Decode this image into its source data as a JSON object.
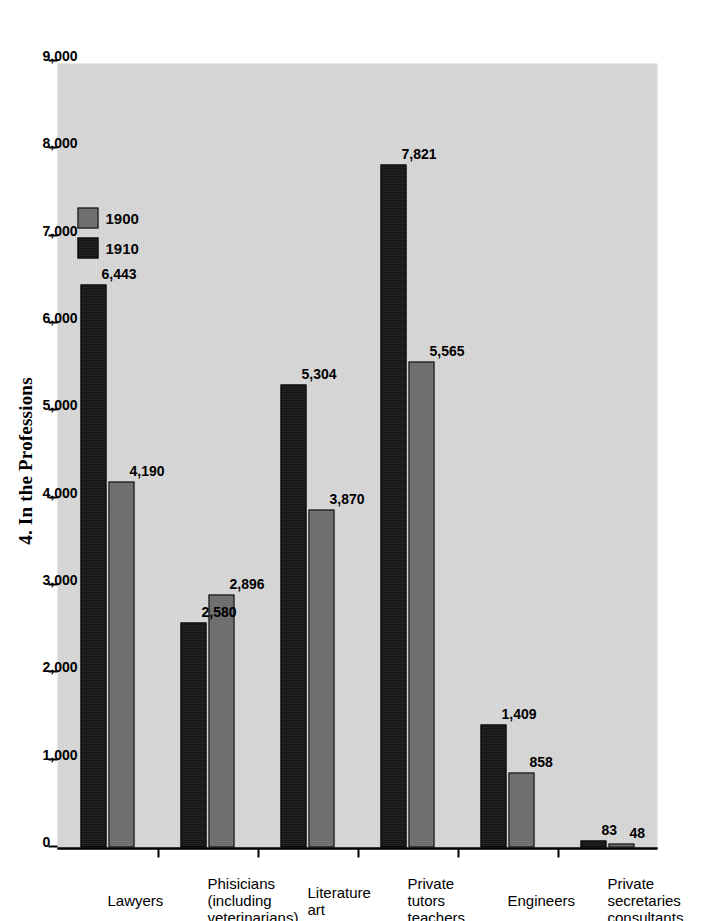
{
  "chart_data": {
    "type": "bar",
    "orientation": "horizontal",
    "title": "4. In the Professions",
    "xlabel": "",
    "ylabel": "",
    "grid": false,
    "legend_position": "top-left-of-plot",
    "xlim": [
      0,
      9000
    ],
    "xticks": [
      "0",
      "1,000",
      "2,000",
      "3,000",
      "4,000",
      "5,000",
      "6,000",
      "7,000",
      "8,000",
      "9,000"
    ],
    "xtick_values": [
      0,
      1000,
      2000,
      3000,
      4000,
      5000,
      6000,
      7000,
      8000,
      9000
    ],
    "categories": [
      "Lawyers",
      "Phisicians\n(including\nveterinarians)",
      "Literature\nart",
      "Private tutors\nteachers",
      "Engineers",
      "Private\nsecretaries\nconsultants"
    ],
    "series": [
      {
        "name": "1900",
        "color": "#6e6e6e",
        "values": [
          4190,
          2896,
          3870,
          5565,
          858,
          48
        ],
        "labels": [
          "4,190",
          "2,896",
          "3,870",
          "5,565",
          "858",
          "48"
        ]
      },
      {
        "name": "1910",
        "color": "#161616",
        "values": [
          6443,
          2580,
          5304,
          7821,
          1409,
          83
        ],
        "labels": [
          "6,443",
          "2,580",
          "5,304",
          "7,821",
          "1,409",
          "83"
        ]
      }
    ]
  },
  "legend": {
    "entries": [
      {
        "label": "1900",
        "swatch": "#6e6e6e"
      },
      {
        "label": "1910",
        "swatch": "#161616"
      }
    ]
  },
  "colors": {
    "plot_background": "#d8d8d8",
    "page_background": "#ffffff",
    "axis": "#000000",
    "series_1900": "#6e6e6e",
    "series_1910": "#161616"
  }
}
